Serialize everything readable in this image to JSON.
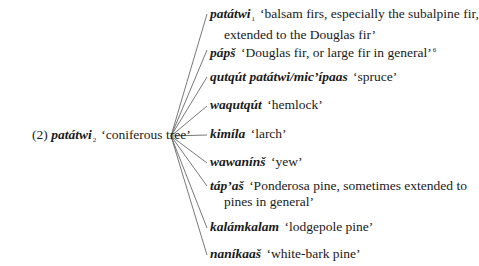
{
  "root": {
    "label": "(2)",
    "term": "patátwi",
    "subscript": "2",
    "gloss": "‘coniferous tree’"
  },
  "children": [
    {
      "term": "patátwi",
      "subscript": "1",
      "gloss_line1": "‘balsam firs, especially the subalpine fir,",
      "gloss_line2": "extended to the Douglas fir’"
    },
    {
      "term": "pápš",
      "gloss_line1": "‘Douglas fir, or large fir in general’",
      "footnote": "6"
    },
    {
      "term": "qutqút patátwi/mic’ípaas",
      "gloss_line1": "‘spruce’"
    },
    {
      "term": "waqutqút",
      "gloss_line1": "‘hemlock’"
    },
    {
      "term": "kimíla",
      "gloss_line1": "‘larch’"
    },
    {
      "term": "wawanínš",
      "gloss_line1": "‘yew’"
    },
    {
      "term": "táp’aš",
      "gloss_line1": "‘Ponderosa pine, sometimes extended to",
      "gloss_line2": "pines in general’"
    },
    {
      "term": "kalámkalam",
      "gloss_line1": "‘lodgepole pine’"
    },
    {
      "term": "naníkaaš",
      "gloss_line1": "‘white-bark pine’"
    }
  ]
}
